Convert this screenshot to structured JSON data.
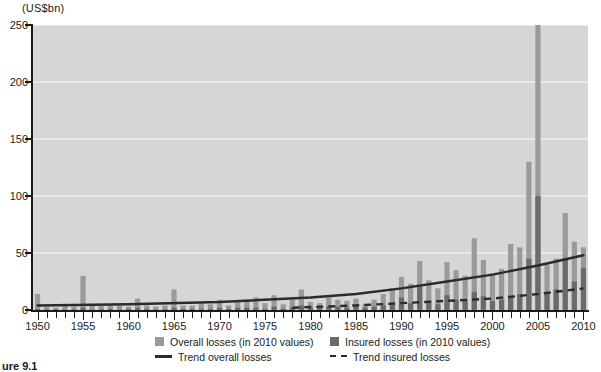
{
  "axis": {
    "y_unit_label": "(US$bn)",
    "y_ticks": [
      0,
      50,
      100,
      150,
      200,
      250
    ],
    "x_tick_labels": [
      1950,
      1955,
      1960,
      1965,
      1970,
      1975,
      1980,
      1985,
      1990,
      1995,
      2000,
      2005,
      2010
    ]
  },
  "legend": {
    "overall_losses": "Overall losses (in 2010 values)",
    "insured_losses": "Insured losses (in 2010 values)",
    "trend_overall": "Trend overall losses",
    "trend_insured": "Trend insured losses"
  },
  "caption": "ure 9.1",
  "colors": {
    "plot_background": "#d6d6d6",
    "overall_bar": "#9a9a9a",
    "insured_bar": "#6b6b6b",
    "trend_line": "#2b2b2b",
    "axis": "#1a1a1a",
    "gridline": "#eeeeee"
  },
  "chart_data": {
    "type": "bar",
    "title": "",
    "subtitle": "",
    "xlabel": "",
    "ylabel": "(US$bn)",
    "ylim": [
      0,
      250
    ],
    "xlim": [
      1949.5,
      2010.5
    ],
    "grid": true,
    "legend_position": "bottom",
    "categories": [
      1950,
      1951,
      1952,
      1953,
      1954,
      1955,
      1956,
      1957,
      1958,
      1959,
      1960,
      1961,
      1962,
      1963,
      1964,
      1965,
      1966,
      1967,
      1968,
      1969,
      1970,
      1971,
      1972,
      1973,
      1974,
      1975,
      1976,
      1977,
      1978,
      1979,
      1980,
      1981,
      1982,
      1983,
      1984,
      1985,
      1986,
      1987,
      1988,
      1989,
      1990,
      1991,
      1992,
      1993,
      1994,
      1995,
      1996,
      1997,
      1998,
      1999,
      2000,
      2001,
      2002,
      2003,
      2004,
      2005,
      2006,
      2007,
      2008,
      2009,
      2010
    ],
    "series": [
      {
        "name": "Overall losses (in 2010 values)",
        "color": "#9a9a9a",
        "values": [
          14,
          3,
          2,
          4,
          3,
          30,
          4,
          4,
          5,
          4,
          3,
          10,
          4,
          3,
          4,
          18,
          4,
          4,
          6,
          5,
          9,
          4,
          7,
          9,
          11,
          6,
          13,
          5,
          9,
          18,
          7,
          6,
          11,
          9,
          8,
          10,
          5,
          9,
          14,
          19,
          29,
          23,
          43,
          26,
          19,
          42,
          35,
          30,
          63,
          44,
          32,
          36,
          58,
          55,
          130,
          250,
          40,
          45,
          85,
          60,
          55
        ]
      },
      {
        "name": "Insured losses (in 2010 values)",
        "color": "#6b6b6b",
        "values": [
          1,
          0.5,
          0.5,
          0.5,
          0.5,
          2,
          0.5,
          0.5,
          1,
          0.5,
          1,
          2,
          1,
          0.5,
          0.5,
          2,
          1,
          1,
          1,
          1,
          2,
          1,
          2,
          2,
          2,
          1,
          3,
          1,
          2,
          4,
          2,
          2,
          3,
          3,
          2,
          3,
          2,
          3,
          4,
          5,
          11,
          6,
          21,
          8,
          5,
          13,
          9,
          8,
          16,
          12,
          8,
          9,
          12,
          14,
          45,
          100,
          14,
          18,
          45,
          25,
          37
        ]
      }
    ],
    "trend_overall": {
      "name": "Trend overall losses",
      "style": "solid",
      "color": "#2b2b2b",
      "points": [
        [
          1950,
          4
        ],
        [
          1960,
          5
        ],
        [
          1970,
          7
        ],
        [
          1980,
          11
        ],
        [
          1985,
          14
        ],
        [
          1990,
          19
        ],
        [
          1995,
          25
        ],
        [
          2000,
          31
        ],
        [
          2005,
          39
        ],
        [
          2010,
          48
        ]
      ]
    },
    "trend_insured": {
      "name": "Trend insured losses",
      "style": "dashed",
      "color": "#2b2b2b",
      "points": [
        [
          1978,
          2
        ],
        [
          1985,
          4
        ],
        [
          1990,
          6
        ],
        [
          1995,
          8
        ],
        [
          2000,
          10
        ],
        [
          2005,
          14
        ],
        [
          2010,
          19
        ]
      ]
    }
  }
}
